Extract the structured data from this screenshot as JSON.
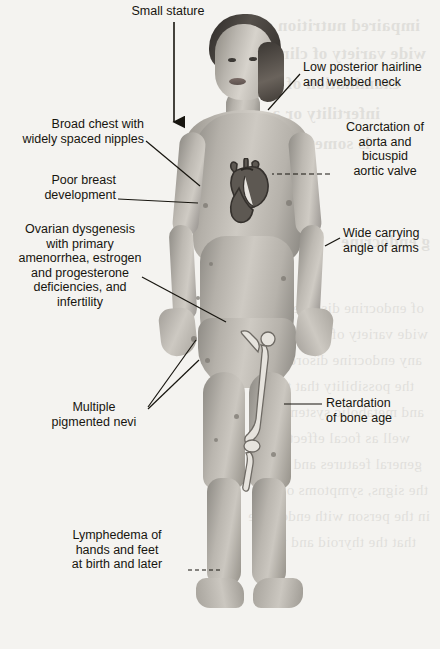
{
  "figure": {
    "ink_color": "#17150f",
    "background_color": "#f4f3f0"
  },
  "labels": [
    {
      "id": "small-stature",
      "name": "label-small-stature",
      "text": "Small stature",
      "align": "center",
      "x": 116,
      "y": 4,
      "width": 104,
      "connector": "down-arrow"
    },
    {
      "id": "low-posterior-hairline",
      "name": "label-low-posterior-hairline-webbed-neck",
      "text": "Low posterior hairline\nand webbed neck",
      "align": "left",
      "x": 303,
      "y": 60,
      "width": 135,
      "connector": "diagonal-line"
    },
    {
      "id": "coarctation",
      "name": "label-coarctation-of-aorta",
      "text": "Coarctation of\naorta and\nbicuspid\naortic valve",
      "align": "center",
      "x": 333,
      "y": 120,
      "width": 104,
      "connector": "dashed-line"
    },
    {
      "id": "broad-chest",
      "name": "label-broad-chest-widely-spaced-nipples",
      "text": "Broad chest with\nwidely spaced nipples",
      "align": "right",
      "x": 10,
      "y": 117,
      "width": 134,
      "connector": "diagonal-line"
    },
    {
      "id": "poor-breast",
      "name": "label-poor-breast-development",
      "text": "Poor breast\ndevelopment",
      "align": "right",
      "x": 40,
      "y": 173,
      "width": 104,
      "connector": "horizontal-line"
    },
    {
      "id": "ovarian-dysgenesis",
      "name": "label-ovarian-dysgenesis",
      "text": "Ovarian dysgenesis\nwith primary\namenorrhea, estrogen\nand progesterone\ndeficiencies, and\ninfertility",
      "align": "center",
      "x": 6,
      "y": 222,
      "width": 148,
      "connector": "diagonal-line"
    },
    {
      "id": "wide-carrying-angle",
      "name": "label-wide-carrying-angle-of-arms",
      "text": "Wide carrying\nangle of arms",
      "align": "left",
      "x": 343,
      "y": 226,
      "width": 96,
      "connector": "short-tick"
    },
    {
      "id": "multiple-pigmented-nevi",
      "name": "label-multiple-pigmented-nevi",
      "text": "Multiple\npigmented nevi",
      "align": "center",
      "x": 38,
      "y": 400,
      "width": 112,
      "connector": "diagonal-line"
    },
    {
      "id": "retardation-bone-age",
      "name": "label-retardation-of-bone-age",
      "text": "Retardation\nof bone age",
      "align": "left",
      "x": 326,
      "y": 396,
      "width": 96,
      "connector": "horizontal-line"
    },
    {
      "id": "lymphedema",
      "name": "label-lymphedema-hands-feet",
      "text": "Lymphedema of\nhands and feet\nat birth and later",
      "align": "center",
      "x": 47,
      "y": 528,
      "width": 140,
      "connector": "dashed-line"
    }
  ],
  "anatomy_overlays": [
    {
      "name": "heart-overlay",
      "label": "heart with aorta",
      "x": 221,
      "y": 158
    },
    {
      "name": "femur-bone-overlay",
      "label": "femur and tibia bone",
      "x": 238,
      "y": 330
    }
  ],
  "ghost_text": [
    {
      "text": "impaired nutrition of the",
      "x": 20,
      "y": 16,
      "big": true
    },
    {
      "text": "wide variety of clinically",
      "x": 14,
      "y": 44,
      "big": true
    },
    {
      "text": "examination of each",
      "x": 40,
      "y": 74,
      "big": true
    },
    {
      "text": "infertility or a",
      "x": 60,
      "y": 104,
      "big": true
    },
    {
      "text": "is sometimes",
      "x": 70,
      "y": 134,
      "big": true
    },
    {
      "text": "g endocrine",
      "x": 10,
      "y": 232,
      "big": true
    },
    {
      "text": "of endocrine disorders",
      "x": 16,
      "y": 300
    },
    {
      "text": "wide variety of presenting",
      "x": 12,
      "y": 326
    },
    {
      "text": "any endocrine disorder is",
      "x": 18,
      "y": 352
    },
    {
      "text": "the possibility that the",
      "x": 26,
      "y": 378
    },
    {
      "text": "and metabolic system to",
      "x": 16,
      "y": 404
    },
    {
      "text": "well as focal effects",
      "x": 30,
      "y": 430
    },
    {
      "text": "general features and so",
      "x": 18,
      "y": 456
    },
    {
      "text": "the signs, symptoms or the",
      "x": 12,
      "y": 482
    },
    {
      "text": "in the person with endocrine",
      "x": 10,
      "y": 508
    },
    {
      "text": "that the thyroid and the",
      "x": 24,
      "y": 534
    }
  ]
}
